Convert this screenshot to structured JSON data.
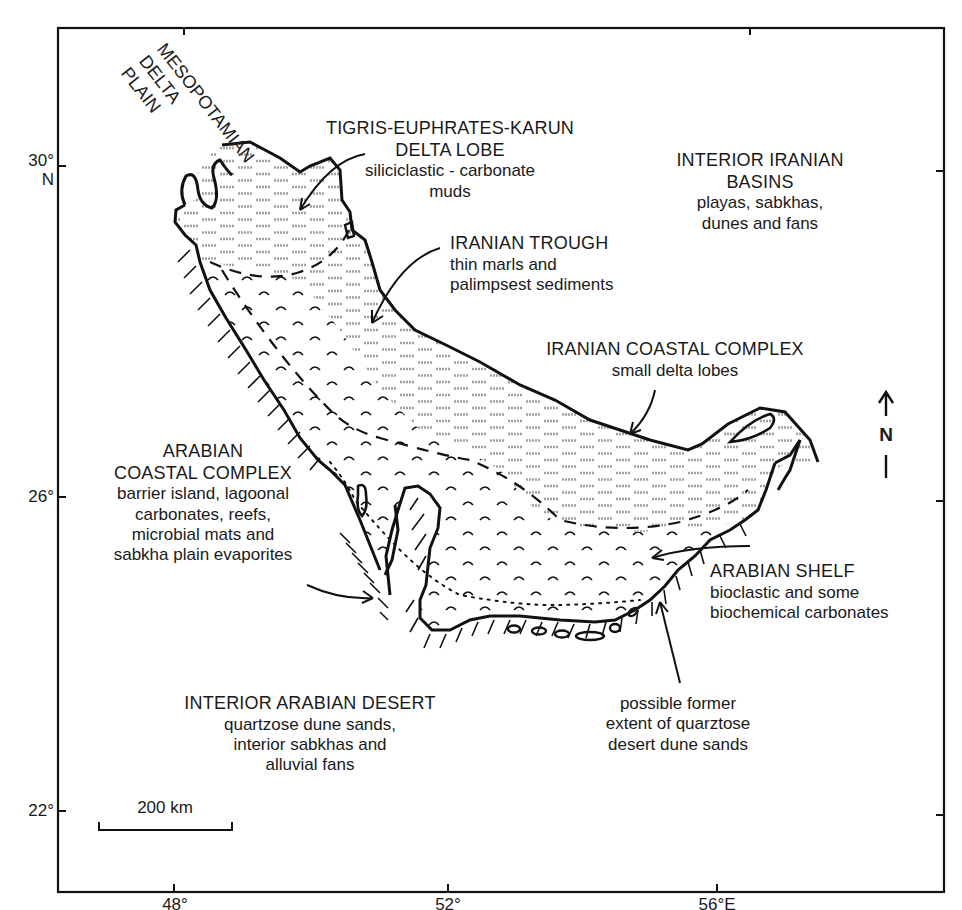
{
  "map": {
    "frame": {
      "left": 58,
      "top": 28,
      "right": 944,
      "bottom": 892
    },
    "latitude_ticks": [
      {
        "label": "30°",
        "sub": "N",
        "y": 166
      },
      {
        "label": "26°",
        "sub": "",
        "y": 497
      },
      {
        "label": "22°",
        "sub": "",
        "y": 811
      }
    ],
    "longitude_ticks": [
      {
        "label": "48°",
        "x": 174
      },
      {
        "label": "52°",
        "x": 448
      },
      {
        "label": "56°E",
        "x": 717
      }
    ],
    "scale_bar": {
      "label": "200 km",
      "x1": 99,
      "x2": 232,
      "y": 826
    },
    "north_arrow": {
      "label": "N",
      "x": 886,
      "y_top": 390,
      "y_bottom": 478
    },
    "colors": {
      "ink": "#111111",
      "mud_dash": "#9a9a9a",
      "background": "#ffffff"
    }
  },
  "labels": {
    "mesopotamian": {
      "lines": [
        "MESOPOTAMIAN",
        "DELTA",
        "PLAIN"
      ]
    },
    "tigris": {
      "title_lines": [
        "TIGRIS-EUPHRATES-KARUN",
        "DELTA LOBE"
      ],
      "desc_lines": [
        "siliciclastic - carbonate",
        "muds"
      ]
    },
    "interior_iranian": {
      "title_lines": [
        "INTERIOR IRANIAN",
        "BASINS"
      ],
      "desc_lines": [
        "playas, sabkhas,",
        "dunes and fans"
      ]
    },
    "iranian_trough": {
      "title_lines": [
        "IRANIAN TROUGH"
      ],
      "desc_lines": [
        "thin marls and",
        "palimpsest sediments"
      ]
    },
    "iranian_coastal": {
      "title_lines": [
        "IRANIAN COASTAL COMPLEX"
      ],
      "desc_lines": [
        "small delta lobes"
      ]
    },
    "arabian_coastal": {
      "title_lines": [
        "ARABIAN",
        "COASTAL COMPLEX"
      ],
      "desc_lines": [
        "barrier island, lagoonal",
        "carbonates, reefs,",
        "microbial mats and",
        "sabkha plain evaporites"
      ]
    },
    "arabian_shelf": {
      "title_lines": [
        "ARABIAN SHELF"
      ],
      "desc_lines": [
        "bioclastic and some",
        "biochemical carbonates"
      ]
    },
    "interior_arabian": {
      "title_lines": [
        "INTERIOR ARABIAN DESERT"
      ],
      "desc_lines": [
        "quartzose dune sands,",
        "interior sabkhas and",
        "alluvial fans"
      ]
    },
    "former_extent": {
      "desc_lines": [
        "possible former",
        "extent of quarztose",
        "desert dune sands"
      ]
    }
  }
}
